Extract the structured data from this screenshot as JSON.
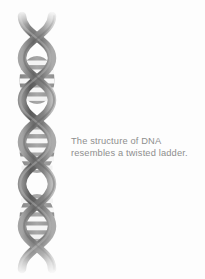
{
  "canvas": {
    "width": 205,
    "height": 279,
    "background_color": "#fdfdfd"
  },
  "caption": {
    "text": "The structure of DNA\nresembles a twisted ladder.",
    "line1": "The structure of DNA",
    "line2": "resembles a twisted ladder.",
    "color": "#8e8e8e"
  },
  "illustration": {
    "name": "dna-double-helix",
    "description": "Grayscale double helix with horizontal ladder rungs, fading at top and bottom",
    "strand_color_dark": "#5d5d5d",
    "strand_color_mid": "#8a8a8a",
    "strand_color_light": "#b8b8b8",
    "rung_light_color": "#f6f6f6",
    "rung_dark_color": "#9a9a9a",
    "turns": 3,
    "rungs_per_turn": 5
  }
}
